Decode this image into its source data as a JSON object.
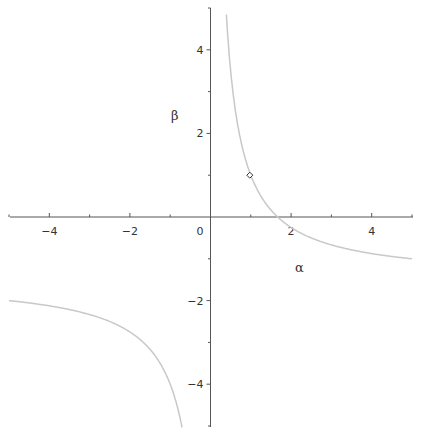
{
  "chart_data": {
    "type": "line",
    "title": "",
    "xlabel": "α",
    "ylabel": "β",
    "xlim": [
      -5,
      5
    ],
    "ylim": [
      -5,
      5
    ],
    "grid": false,
    "x_ticks": [
      -4,
      -2,
      0,
      2,
      4
    ],
    "y_ticks": [
      -4,
      -2,
      2,
      4
    ],
    "x_tick_labels": [
      "−4",
      "−2",
      "0",
      "2",
      "4"
    ],
    "y_tick_labels": [
      "−4",
      "−2",
      "2",
      "4"
    ],
    "series": [
      {
        "name": "curve",
        "description": "hyperbola approx β = (2.5 − 1.5α)/α",
        "color": "#c8c8c8",
        "points_right_branch": [
          [
            0.36,
            5
          ],
          [
            0.5,
            3.5
          ],
          [
            1,
            1
          ],
          [
            1.65,
            0
          ],
          [
            2,
            -0.25
          ],
          [
            3,
            -0.67
          ],
          [
            4,
            -0.88
          ],
          [
            5,
            -1.0
          ]
        ],
        "points_left_branch": [
          [
            -5,
            -2.0
          ],
          [
            -4,
            -2.13
          ],
          [
            -3,
            -2.33
          ],
          [
            -2,
            -2.75
          ],
          [
            -1,
            -4.0
          ],
          [
            -0.7,
            -5
          ]
        ]
      }
    ],
    "annotations": [
      {
        "type": "marker",
        "shape": "diamond",
        "x": 1,
        "y": 1
      }
    ]
  }
}
